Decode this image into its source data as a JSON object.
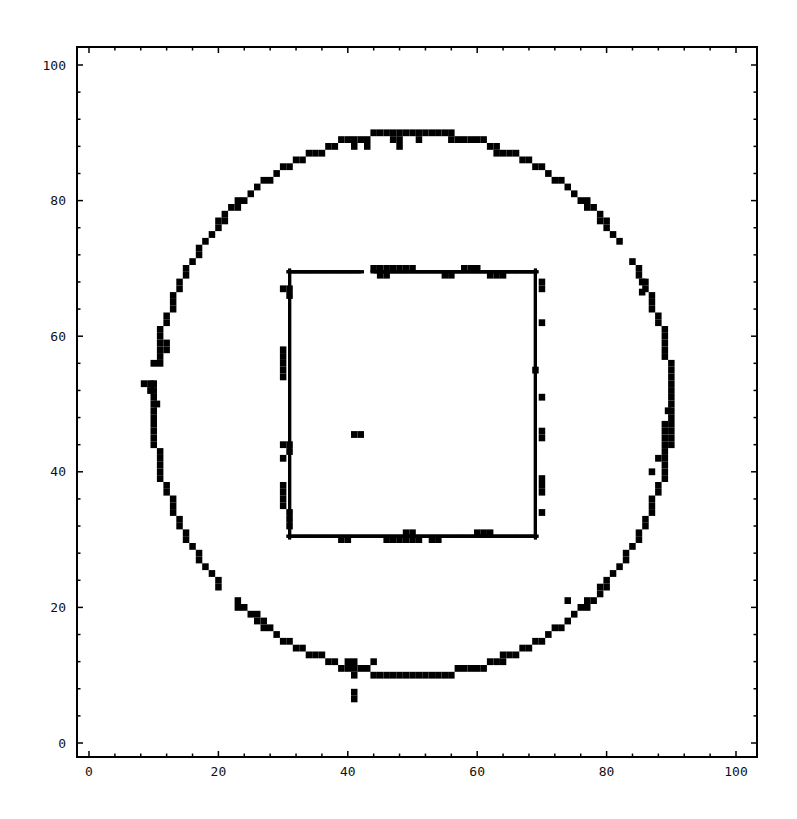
{
  "chart_data": {
    "type": "scatter",
    "title": "",
    "xlabel": "",
    "ylabel": "",
    "xlim": [
      -2,
      103
    ],
    "ylim": [
      -2,
      103
    ],
    "grid": false,
    "legend": null,
    "frame": true,
    "x_ticks": [
      0,
      20,
      40,
      60,
      80,
      100
    ],
    "y_ticks": [
      0,
      20,
      40,
      60,
      80,
      100
    ],
    "minor_tick_step": 4,
    "marker": "filled-square",
    "marker_color": "#000000",
    "shapes": [
      {
        "name": "circle",
        "cx": 50,
        "cy": 50,
        "r": 40
      },
      {
        "name": "square",
        "x0": 31,
        "x1": 69,
        "y0": 30.5,
        "y1": 69.5
      }
    ],
    "extra_points": [
      [
        41,
        45.5
      ],
      [
        42,
        45.5
      ],
      [
        41,
        6.5
      ],
      [
        41,
        7.5
      ],
      [
        74,
        21
      ],
      [
        85.5,
        68
      ],
      [
        85.5,
        66.5
      ]
    ],
    "thick_patches": [
      [
        40,
        89
      ],
      [
        41,
        89
      ],
      [
        42,
        89
      ],
      [
        43,
        88
      ],
      [
        41,
        88
      ],
      [
        47,
        89
      ],
      [
        48,
        89
      ],
      [
        48,
        88
      ],
      [
        51,
        89
      ],
      [
        60,
        89
      ],
      [
        61,
        89
      ],
      [
        62,
        88
      ],
      [
        63,
        88
      ],
      [
        63,
        87
      ],
      [
        64,
        87
      ],
      [
        57,
        89
      ],
      [
        56,
        89
      ],
      [
        8.5,
        53
      ],
      [
        9.5,
        53
      ],
      [
        9.5,
        52
      ],
      [
        10,
        51
      ],
      [
        10.5,
        50
      ],
      [
        11,
        56
      ],
      [
        11,
        57
      ],
      [
        12,
        58
      ],
      [
        12,
        59
      ],
      [
        10,
        47
      ],
      [
        11,
        43
      ],
      [
        89,
        44
      ],
      [
        89,
        45
      ],
      [
        89,
        46
      ],
      [
        89,
        47
      ],
      [
        90,
        48
      ],
      [
        90,
        46
      ],
      [
        89.5,
        49
      ],
      [
        88,
        42
      ],
      [
        87,
        40
      ],
      [
        23,
        21
      ],
      [
        24,
        20
      ],
      [
        25,
        19
      ],
      [
        26,
        19
      ],
      [
        27,
        18
      ],
      [
        40,
        12
      ],
      [
        41,
        12
      ],
      [
        42,
        11
      ],
      [
        43,
        11
      ],
      [
        44,
        12
      ],
      [
        41,
        10
      ],
      [
        60,
        11
      ],
      [
        61,
        11
      ],
      [
        63,
        12
      ],
      [
        64,
        12
      ],
      [
        30,
        58
      ],
      [
        30,
        57
      ],
      [
        30,
        56
      ],
      [
        30,
        55
      ],
      [
        30,
        54
      ],
      [
        30,
        38
      ],
      [
        30,
        37
      ],
      [
        30,
        36
      ],
      [
        30,
        35
      ],
      [
        31,
        34
      ],
      [
        31,
        33
      ],
      [
        31,
        32
      ],
      [
        30,
        44
      ],
      [
        30,
        42
      ],
      [
        31,
        43
      ],
      [
        31,
        44
      ],
      [
        31,
        66
      ],
      [
        30,
        67
      ],
      [
        31,
        67
      ],
      [
        44,
        70
      ],
      [
        45,
        70
      ],
      [
        46,
        70
      ],
      [
        47,
        70
      ],
      [
        48,
        70
      ],
      [
        49,
        70
      ],
      [
        50,
        70
      ],
      [
        45,
        69
      ],
      [
        46,
        69
      ],
      [
        58,
        70
      ],
      [
        59,
        70
      ],
      [
        60,
        70
      ],
      [
        55,
        69
      ],
      [
        56,
        69
      ],
      [
        62,
        69
      ],
      [
        63,
        69
      ],
      [
        64,
        69
      ],
      [
        39,
        30
      ],
      [
        40,
        30
      ],
      [
        46,
        30
      ],
      [
        47,
        30
      ],
      [
        48,
        30
      ],
      [
        49,
        30
      ],
      [
        50,
        30
      ],
      [
        51,
        30
      ],
      [
        49,
        31
      ],
      [
        50,
        31
      ],
      [
        60,
        31
      ],
      [
        61,
        31
      ],
      [
        62,
        31
      ],
      [
        53,
        30
      ],
      [
        54,
        30
      ],
      [
        70,
        62
      ],
      [
        70,
        51
      ],
      [
        70,
        46
      ],
      [
        70,
        45
      ],
      [
        70,
        39
      ],
      [
        70,
        38
      ],
      [
        70,
        37
      ],
      [
        70,
        34
      ],
      [
        70,
        68
      ],
      [
        70,
        67
      ],
      [
        69,
        55
      ]
    ],
    "gaps": [
      {
        "shape": "circle",
        "angle_deg_from": 172,
        "angle_deg_to": 175
      },
      {
        "shape": "circle",
        "angle_deg_from": 33,
        "angle_deg_to": 35
      },
      {
        "shape": "circle",
        "angle_deg_from": -30,
        "angle_deg_to": -28
      },
      {
        "shape": "circle",
        "angle_deg_from": -137,
        "angle_deg_to": -134
      },
      {
        "shape": "square-top",
        "x_from": 42,
        "x_to": 44
      }
    ]
  },
  "axes": {
    "x_tick_labels": [
      "0",
      "20",
      "40",
      "60",
      "80",
      "100"
    ],
    "y_tick_labels": [
      "0",
      "20",
      "40",
      "60",
      "80",
      "100"
    ]
  }
}
